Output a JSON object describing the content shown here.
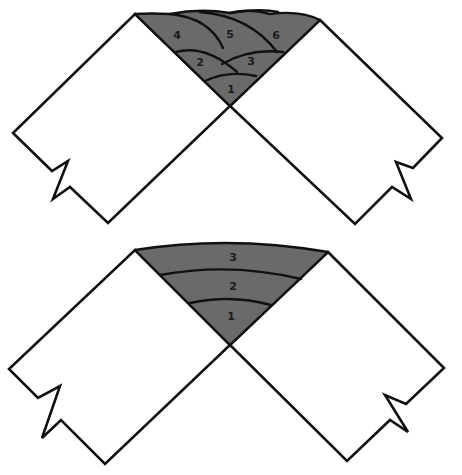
{
  "colors": {
    "weld_fill": "#6a6a6a",
    "outline": "#111111",
    "plate_fill": "#ffffff",
    "background": "#ffffff"
  },
  "diagrams": [
    {
      "name": "multi-pass-stringer-beads",
      "bead_labels": [
        "1",
        "2",
        "3",
        "4",
        "5",
        "6"
      ]
    },
    {
      "name": "multi-pass-layered-beads",
      "bead_labels": [
        "1",
        "2",
        "3"
      ]
    }
  ]
}
